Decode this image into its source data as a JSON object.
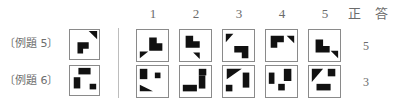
{
  "header": {
    "option_numbers": [
      "1",
      "2",
      "3",
      "4",
      "5"
    ],
    "answer_label_1": "正",
    "answer_label_2": "答"
  },
  "divider": {
    "color": "#bdbdbd"
  },
  "ink_color": "#111111",
  "rows": [
    {
      "label": "〔例題 5〕",
      "answer": "5",
      "problem": {
        "name": "problem-figure",
        "shapes": [
          {
            "type": "polygon",
            "points": "20,1 29,1 29,10"
          },
          {
            "type": "polygon",
            "points": "8,13 20,13 20,20 14,20 14,25 8,25"
          }
        ]
      },
      "options": [
        {
          "number": "1",
          "shapes": [
            {
              "type": "polygon",
              "points": "13,8 21,8 21,14 27,14 27,22 13,22"
            },
            {
              "type": "polygon",
              "points": "3,23 12,23 3,30"
            }
          ]
        },
        {
          "number": "2",
          "shapes": [
            {
              "type": "polygon",
              "points": "6,6 14,6 14,12 21,12 21,19 6,19"
            },
            {
              "type": "polygon",
              "points": "14,24 21,24 21,31"
            }
          ]
        },
        {
          "number": "3",
          "shapes": [
            {
              "type": "polygon",
              "points": "3,4 11,4 3,13"
            },
            {
              "type": "polygon",
              "points": "12,17 27,17 27,30 20,30 20,24 12,24"
            }
          ]
        },
        {
          "number": "4",
          "shapes": [
            {
              "type": "polygon",
              "points": "5,6 19,6 19,13 12,13 12,19 5,19"
            },
            {
              "type": "polygon",
              "points": "22,6 30,6 30,14"
            }
          ]
        },
        {
          "number": "5",
          "shapes": [
            {
              "type": "polygon",
              "points": "7,10 15,10 15,17 22,17 22,24 7,24"
            },
            {
              "type": "polygon",
              "points": "23,22 31,22 31,30"
            }
          ]
        }
      ]
    },
    {
      "label": "〔例題 6〕",
      "answer": "3",
      "problem": {
        "name": "problem-figure",
        "shapes": [
          {
            "type": "rect",
            "x": 9,
            "y": 2,
            "w": 13,
            "h": 7
          },
          {
            "type": "polygon",
            "points": "4,12 11,12 11,24 4,24"
          },
          {
            "type": "rect",
            "x": 21,
            "y": 19,
            "w": 7,
            "h": 6
          }
        ]
      },
      "options": [
        {
          "number": "1",
          "shapes": [
            {
              "type": "rect",
              "x": 3,
              "y": 3,
              "w": 8,
              "h": 11
            },
            {
              "type": "rect",
              "x": 19,
              "y": 7,
              "w": 6,
              "h": 6
            },
            {
              "type": "polygon",
              "points": "3,20 17,27 3,27"
            }
          ]
        },
        {
          "number": "2",
          "shapes": [
            {
              "type": "rect",
              "x": 20,
              "y": 3,
              "w": 8,
              "h": 7
            },
            {
              "type": "polygon",
              "points": "20,10 27,10 27,24 20,24"
            },
            {
              "type": "rect",
              "x": 3,
              "y": 20,
              "w": 15,
              "h": 7
            }
          ]
        },
        {
          "number": "3",
          "shapes": [
            {
              "type": "polygon",
              "points": "4,3 20,3 4,14"
            },
            {
              "type": "rect",
              "x": 21,
              "y": 7,
              "w": 7,
              "h": 16
            },
            {
              "type": "rect",
              "x": 3,
              "y": 20,
              "w": 7,
              "h": 7
            }
          ]
        },
        {
          "number": "4",
          "shapes": [
            {
              "type": "rect",
              "x": 3,
              "y": 7,
              "w": 6,
              "h": 12
            },
            {
              "type": "polygon",
              "points": "19,3 27,3 27,16 19,16"
            },
            {
              "type": "rect",
              "x": 13,
              "y": 19,
              "w": 7,
              "h": 7
            }
          ]
        },
        {
          "number": "5",
          "shapes": [
            {
              "type": "polygon",
              "points": "3,3 15,3 3,17"
            },
            {
              "type": "rect",
              "x": 20,
              "y": 3,
              "w": 8,
              "h": 8
            },
            {
              "type": "rect",
              "x": 8,
              "y": 19,
              "w": 15,
              "h": 7
            }
          ]
        }
      ]
    }
  ],
  "geometry": {
    "problem_left": 69,
    "option_lefts": [
      136,
      179,
      222,
      265,
      308
    ],
    "answer_left": 356,
    "row_tops": [
      29,
      65
    ],
    "fig_size": 31
  }
}
